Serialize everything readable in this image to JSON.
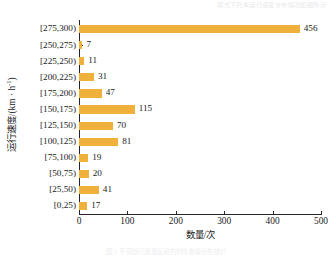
{
  "scan": {
    "bleed_top": "模式下列车运行速度分布情况如图所示",
    "bleed_bottom": "图 5   不同运行速度区间的列车数量分布统计"
  },
  "chart_data": {
    "type": "bar",
    "orientation": "horizontal",
    "title": "",
    "subtitle": "",
    "xlabel": "数量/次",
    "ylabel": "运行速度/(km · h",
    "ylabel_sup": "-1",
    "ylabel_tail": ")",
    "categories": [
      "[0,25)",
      "[25,50)",
      "[50,75)",
      "[75,100)",
      "[100,125)",
      "[125,150)",
      "[150,175)",
      "[175,200)",
      "[200,225)",
      "[225,250)",
      "[250,275)",
      "[275,300)"
    ],
    "values": [
      17,
      41,
      20,
      19,
      81,
      70,
      115,
      47,
      31,
      11,
      7,
      456
    ],
    "value_labels": [
      "17",
      "41",
      "20",
      "19",
      "81",
      "70",
      "115",
      "47",
      "31",
      "11",
      "7",
      "456"
    ],
    "xlim": [
      0,
      500
    ],
    "xticks": [
      0,
      100,
      200,
      300,
      400,
      500
    ],
    "xtick_labels": [
      "0",
      "100",
      "200",
      "300",
      "400",
      "500"
    ],
    "grid": false,
    "legend": null,
    "colors": {
      "bar": "#F0B03C",
      "axis": "#24242a",
      "text": "#1a1a1a",
      "background": "#ffffff"
    }
  }
}
